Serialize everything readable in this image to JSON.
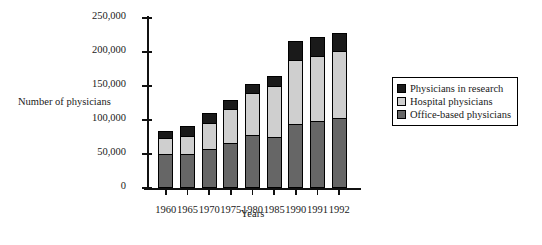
{
  "chart_data": {
    "type": "bar",
    "stacked": true,
    "title": "",
    "xlabel": "Years",
    "ylabel": "Number of physicians",
    "categories": [
      "1960",
      "1965",
      "1970",
      "1975",
      "1980",
      "1985",
      "1990",
      "1991",
      "1992"
    ],
    "series": [
      {
        "name": "Office-based physicians",
        "color": "#666666",
        "values": [
          48000,
          49000,
          56000,
          64000,
          77000,
          73000,
          92000,
          97000,
          101000
        ]
      },
      {
        "name": "Hospital physicians",
        "color": "#cfcfcf",
        "values": [
          24000,
          26000,
          38000,
          50000,
          61000,
          75000,
          95000,
          96000,
          99000
        ]
      },
      {
        "name": "Physicians in research",
        "color": "#1a1a1a",
        "values": [
          11000,
          14000,
          15000,
          14000,
          14000,
          16000,
          28000,
          27000,
          27000
        ]
      }
    ],
    "totals": [
      83000,
      89000,
      109000,
      128000,
      152000,
      164000,
      215000,
      220000,
      227000
    ],
    "ylim": [
      0,
      250000
    ],
    "yticks": [
      0,
      50000,
      100000,
      150000,
      200000,
      250000
    ],
    "ytick_labels": [
      "0",
      "50,000",
      "100,000",
      "150,000",
      "200,000",
      "250,000"
    ],
    "grid": false,
    "legend_position": "right",
    "legend_order": [
      "Physicians in research",
      "Hospital physicians",
      "Office-based physicians"
    ]
  },
  "legend": {
    "items": [
      {
        "label": "Physicians in research",
        "color": "#1a1a1a"
      },
      {
        "label": "Hospital physicians",
        "color": "#cfcfcf"
      },
      {
        "label": "Office-based physicians",
        "color": "#666666"
      }
    ]
  },
  "axes": {
    "ylabel": "Number of physicians",
    "xlabel": "Years"
  }
}
